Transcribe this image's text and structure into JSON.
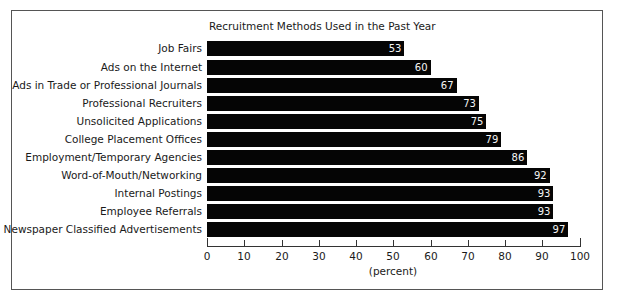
{
  "chart_data": {
    "type": "bar",
    "orientation": "horizontal",
    "title": "Recruitment Methods Used in the Past Year",
    "xlabel": "(percent)",
    "ylabel": "",
    "xlim": [
      0,
      100
    ],
    "xticks": [
      "0",
      "10",
      "20",
      "30",
      "40",
      "50",
      "60",
      "70",
      "80",
      "90",
      "100"
    ],
    "grid": false,
    "legend": null,
    "bar_color": "#050505",
    "value_label_color": "#f5f5f5",
    "categories": [
      "Job Fairs",
      "Ads on the Internet",
      "Ads in Trade or Professional Journals",
      "Professional Recruiters",
      "Unsolicited Applications",
      "College Placement Offices",
      "Employment/Temporary Agencies",
      "Word-of-Mouth/Networking",
      "Internal Postings",
      "Employee Referrals",
      "Newspaper Classified Advertisements"
    ],
    "values": [
      53,
      60,
      67,
      73,
      75,
      79,
      86,
      92,
      93,
      93,
      97
    ],
    "value_labels": [
      "53",
      "60",
      "67",
      "73",
      "75",
      "79",
      "86",
      "92",
      "93",
      "93",
      "97"
    ]
  }
}
